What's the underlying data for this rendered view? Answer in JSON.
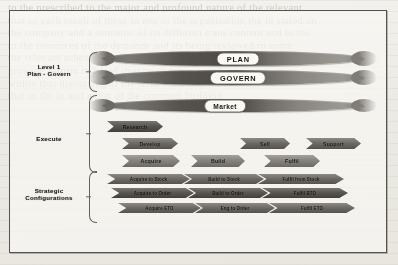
{
  "figure": {
    "groups": [
      {
        "id": "level1",
        "lines": [
          "Level 1",
          "Plan - Govern"
        ]
      },
      {
        "id": "execute",
        "lines": [
          "Execute"
        ]
      },
      {
        "id": "strategic",
        "lines": [
          "Strategic",
          "Configurations"
        ]
      }
    ],
    "lens_bars": [
      {
        "id": "plan",
        "label": "PLAN"
      },
      {
        "id": "govern",
        "label": "GOVERN"
      },
      {
        "id": "market",
        "label": "Market"
      }
    ],
    "execute_rows": [
      {
        "id": "row-research",
        "items": [
          "Research"
        ]
      },
      {
        "id": "row-develop",
        "items": [
          "Develop",
          "Sell",
          "Support"
        ]
      },
      {
        "id": "row-acquire",
        "items": [
          "Acquire",
          "Build",
          "Fulfil"
        ]
      }
    ],
    "strategic_rows": [
      {
        "id": "row-stock",
        "items": [
          "Acquire to Stock",
          "Build to Stock",
          "Fulfil from Stock"
        ]
      },
      {
        "id": "row-order",
        "items": [
          "Acquire to Order",
          "Build to Order",
          "Fulfil BTO"
        ]
      },
      {
        "id": "row-eto",
        "items": [
          "Acquire ETO",
          "Eng to Order",
          "Fulfil ETO"
        ]
      }
    ]
  },
  "background_text": {
    "lines": [
      "to the prescribed to the major and profound nature of the relevant",
      "that so each result of these in one or the organisation the in stated on",
      "the company and a semantic of its different trans content and to the",
      "",
      "",
      "",
      "",
      "",
      "",
      "",
      "",
      "to the resources of the demands and its being reviewed in some",
      "",
      "",
      "",
      "the relevant scheme of the management and internal the research",
      "",
      "",
      "",
      "",
      "growing reform in based in state of achieve and",
      "within that discussing of the term when important",
      "that to the in and a that of the common building"
    ]
  },
  "colors": {
    "frame": "#55534e",
    "lens_dark": "#4e4b47",
    "lens_light": "#9b9893",
    "pill_fill": "#f6f5f1",
    "page": "#efeeea"
  }
}
